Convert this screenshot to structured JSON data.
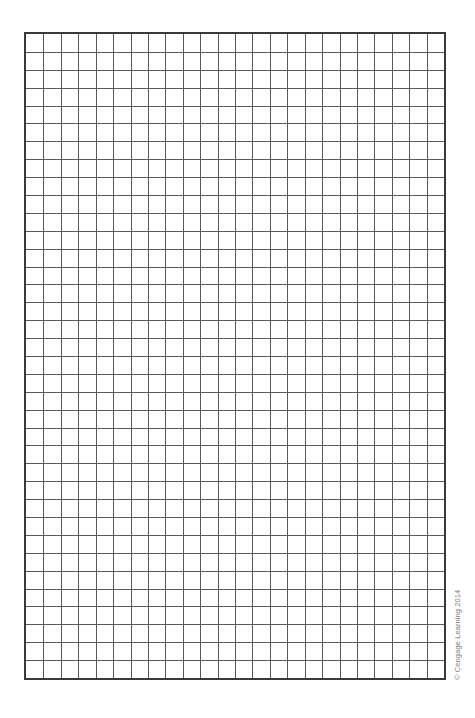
{
  "page": {
    "type": "blank graph paper"
  },
  "grid": {
    "columns": 24,
    "rows": 36,
    "line_color": "#5a5a5a",
    "border_color": "#3a3a3a",
    "background": "#ffffff"
  },
  "footer": {
    "copyright": "© Cengage Learning 2014"
  }
}
